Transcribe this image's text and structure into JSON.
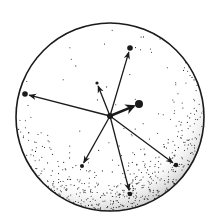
{
  "diagram": {
    "sphere": {
      "cx": 110,
      "cy": 117,
      "r": 94,
      "stroke": "#1a1a1a",
      "fill": "#ffffff"
    },
    "center": {
      "x": 110,
      "y": 116,
      "r": 3
    },
    "vectors": [
      {
        "name": "to-top",
        "x": 130,
        "y": 48,
        "dot_r": 2.8,
        "arrow": true
      },
      {
        "name": "to-left",
        "x": 25,
        "y": 94,
        "dot_r": 2.8,
        "arrow": true
      },
      {
        "name": "to-right-bottom",
        "x": 176,
        "y": 165,
        "dot_r": 2.3,
        "arrow": true
      },
      {
        "name": "to-bottom",
        "x": 130,
        "y": 194,
        "dot_r": 2.3,
        "arrow": true
      },
      {
        "name": "to-bottom-left",
        "x": 82,
        "y": 166,
        "dot_r": 2,
        "arrow": true
      },
      {
        "name": "to-upper-left-short",
        "x": 97,
        "y": 83,
        "dot_r": 1.6,
        "arrow": true
      },
      {
        "name": "to-right-short-bold",
        "x": 139,
        "y": 104,
        "dot_r": 4,
        "arrow": true,
        "bold": true
      }
    ],
    "colors": {
      "ink": "#1a1a1a",
      "paper": "#ffffff"
    }
  }
}
